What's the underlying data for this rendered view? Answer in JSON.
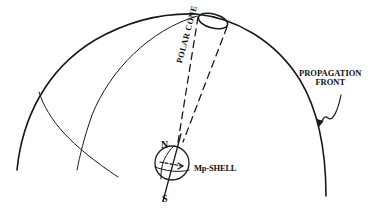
{
  "figure": {
    "labels": {
      "polar_cone": "POLAR CONE",
      "north": "N",
      "south": "S",
      "mp_shell": "Mp-SHELL",
      "propagation_front_line1": "PROPAGATION",
      "propagation_front_line2": "FRONT"
    },
    "colors": {
      "stroke": "#1a1a1a",
      "background": "#ffffff"
    }
  }
}
